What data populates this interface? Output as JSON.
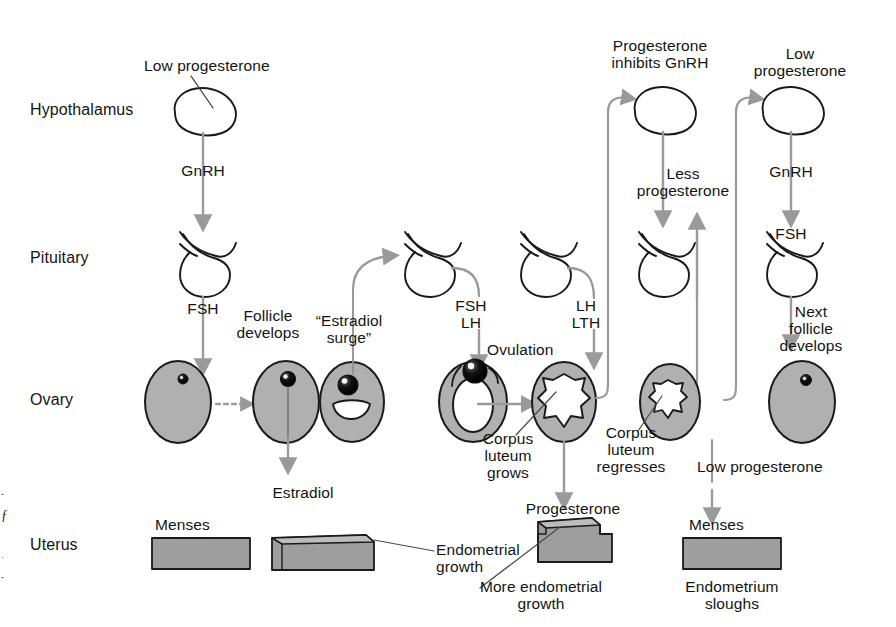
{
  "figure": {
    "colors": {
      "organ_fill": "#b0b0b0",
      "organ_stroke": "#1a1a1a",
      "arrow_gray": "#9a9a9a",
      "leader_line": "#555555",
      "endometrium_fill": "#9e9e9e",
      "endometrium_top": "#bdbdbd",
      "text": "#141414",
      "background": "#ffffff",
      "ovum_fill": "#000000"
    }
  },
  "row_labels": [
    {
      "id": "hypothalamus",
      "label": "Hypothalamus"
    },
    {
      "id": "pituitary",
      "label": "Pituitary"
    },
    {
      "id": "ovary",
      "label": "Ovary"
    },
    {
      "id": "uterus",
      "label": "Uterus"
    }
  ],
  "annotations": {
    "low_progesterone_1": "Low progesterone",
    "gnrh_1": "GnRH",
    "fsh_1": "FSH",
    "follicle_develops": "Follicle\ndevelops",
    "estradiol_surge": "“Estradiol\nsurge”",
    "fsh_lh": "FSH\nLH",
    "ovulation": "Ovulation",
    "lh_lth": "LH\nLTH",
    "corpus_luteum_grows": "Corpus\nluteum\ngrows",
    "progesterone_inhibits_gnrh": "Progesterone\ninhibits GnRH",
    "less_progesterone": "Less\nprogesterone",
    "low_progesterone_2": "Low\nprogesterone",
    "gnrh_2": "GnRH",
    "fsh_2": "FSH",
    "corpus_luteum_regresses": "Corpus\nluteum\nregresses",
    "low_progesterone_3": "Low progesterone",
    "next_follicle_develops": "Next\nfollicle\ndevelops",
    "estradiol": "Estradiol",
    "menses_1": "Menses",
    "endometrial_growth": "Endometrial\ngrowth",
    "progesterone": "Progesterone",
    "more_endometrial_growth": "More endometrial\ngrowth",
    "menses_2": "Menses",
    "endometrium_sloughs": "Endometrium\nsloughs"
  },
  "margin_marks": [
    "-",
    "ƒ",
    "·",
    "-"
  ]
}
